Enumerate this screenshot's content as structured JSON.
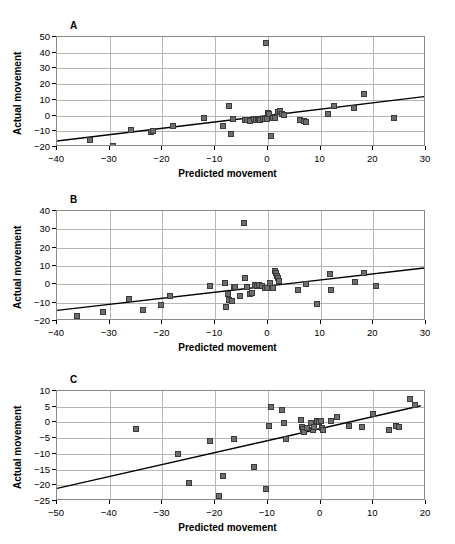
{
  "page": {
    "running_head": "",
    "page_number": ""
  },
  "axis": {
    "xlabel": "Predicted movement",
    "ylabel": "Actual movement"
  },
  "chart_data": [
    {
      "type": "scatter",
      "panel": "A",
      "title": "",
      "xlabel": "Predicted movement",
      "ylabel": "Actual movement",
      "xlim": [
        -40,
        30
      ],
      "ylim": [
        -20,
        50
      ],
      "xticks": [
        -40,
        -30,
        -20,
        -10,
        0,
        10,
        20,
        30
      ],
      "yticks": [
        -20,
        -10,
        0,
        10,
        20,
        30,
        40,
        50
      ],
      "grid": true,
      "legend": "none",
      "marker": "filled-square",
      "trendline": {
        "x": [
          -40,
          30
        ],
        "y": [
          -16.2,
          12.2
        ]
      },
      "points": [
        [
          -33.8,
          -15.6
        ],
        [
          -29.4,
          -19.3
        ],
        [
          -26.0,
          -9.4
        ],
        [
          -22.2,
          -10.2
        ],
        [
          -21.7,
          -9.8
        ],
        [
          -18.0,
          -6.8
        ],
        [
          -12.1,
          -1.8
        ],
        [
          -8.6,
          -6.7
        ],
        [
          -7.3,
          6.3
        ],
        [
          -7.0,
          -11.6
        ],
        [
          -6.6,
          -2.0
        ],
        [
          -4.3,
          -3.0
        ],
        [
          -3.9,
          -2.6
        ],
        [
          -3.3,
          -3.2
        ],
        [
          -2.6,
          -2.3
        ],
        [
          -2.3,
          -2.6
        ],
        [
          -1.9,
          -2.4
        ],
        [
          -1.6,
          -2.2
        ],
        [
          -1.4,
          -3.0
        ],
        [
          -1.0,
          -2.2
        ],
        [
          -0.6,
          -1.9
        ],
        [
          -0.4,
          46.0
        ],
        [
          -0.2,
          -2.0
        ],
        [
          0.1,
          1.8
        ],
        [
          0.3,
          0.8
        ],
        [
          0.6,
          -13.0
        ],
        [
          0.9,
          -1.6
        ],
        [
          1.4,
          -1.3
        ],
        [
          2.0,
          2.2
        ],
        [
          2.3,
          2.6
        ],
        [
          2.6,
          0.9
        ],
        [
          3.0,
          0.6
        ],
        [
          6.1,
          -3.0
        ],
        [
          6.8,
          -3.4
        ],
        [
          7.2,
          -4.2
        ],
        [
          11.5,
          0.9
        ],
        [
          12.6,
          5.9
        ],
        [
          16.3,
          4.8
        ],
        [
          18.3,
          13.8
        ],
        [
          23.9,
          -1.6
        ]
      ]
    },
    {
      "type": "scatter",
      "panel": "B",
      "title": "",
      "xlabel": "Predicted movement",
      "ylabel": "Actual movement",
      "xlim": [
        -40,
        30
      ],
      "ylim": [
        -20,
        40
      ],
      "xticks": [
        -40,
        -30,
        -20,
        -10,
        0,
        10,
        20,
        30
      ],
      "yticks": [
        -20,
        -10,
        0,
        10,
        20,
        30,
        40
      ],
      "grid": true,
      "legend": "none",
      "marker": "filled-square",
      "trendline": {
        "x": [
          -40,
          30
        ],
        "y": [
          -14.2,
          9.0
        ]
      },
      "points": [
        [
          -36.3,
          -17.2
        ],
        [
          -31.2,
          -15.2
        ],
        [
          -26.4,
          -7.9
        ],
        [
          -23.7,
          -14.1
        ],
        [
          -20.2,
          -11.3
        ],
        [
          -18.6,
          -6.5
        ],
        [
          -11.0,
          -1.1
        ],
        [
          -8.1,
          0.6
        ],
        [
          -7.9,
          -12.3
        ],
        [
          -7.6,
          -5.2
        ],
        [
          -7.3,
          -8.7
        ],
        [
          -6.8,
          -8.9
        ],
        [
          -6.5,
          -1.4
        ],
        [
          -6.2,
          -1.7
        ],
        [
          -5.3,
          -6.4
        ],
        [
          -4.6,
          33.4
        ],
        [
          -4.4,
          3.7
        ],
        [
          -4.0,
          -1.2
        ],
        [
          -3.4,
          -5.0
        ],
        [
          -3.0,
          -4.5
        ],
        [
          -2.4,
          -0.6
        ],
        [
          -2.1,
          -0.9
        ],
        [
          -1.6,
          -0.5
        ],
        [
          -1.2,
          -0.8
        ],
        [
          -0.6,
          -2.2
        ],
        [
          -0.2,
          -1.8
        ],
        [
          0.4,
          0.5
        ],
        [
          1.0,
          -2.1
        ],
        [
          1.4,
          7.4
        ],
        [
          1.6,
          6.1
        ],
        [
          1.8,
          4.8
        ],
        [
          2.0,
          3.2
        ],
        [
          2.2,
          2.0
        ],
        [
          5.8,
          -2.9
        ],
        [
          7.3,
          0.2
        ],
        [
          9.4,
          -10.9
        ],
        [
          11.8,
          5.4
        ],
        [
          12.0,
          -3.1
        ],
        [
          16.5,
          1.1
        ],
        [
          18.2,
          6.4
        ],
        [
          20.5,
          -1.0
        ]
      ]
    },
    {
      "type": "scatter",
      "panel": "C",
      "title": "",
      "xlabel": "Predicted movement",
      "ylabel": "Actual movement",
      "xlim": [
        -50,
        20
      ],
      "ylim": [
        -25,
        10
      ],
      "xticks": [
        -50,
        -40,
        -30,
        -20,
        -10,
        0,
        10,
        20
      ],
      "yticks": [
        -25,
        -20,
        -15,
        -10,
        -5,
        0,
        5,
        10
      ],
      "grid": true,
      "legend": "none",
      "marker": "filled-square",
      "trendline": {
        "x": [
          -50,
          19
        ],
        "y": [
          -21.0,
          5.3
        ]
      },
      "points": [
        [
          -48.7,
          -25.3
        ],
        [
          -35.1,
          -2.0
        ],
        [
          -27.0,
          -10.1
        ],
        [
          -24.9,
          -19.4
        ],
        [
          -21.0,
          -6.0
        ],
        [
          -19.3,
          -23.5
        ],
        [
          -18.6,
          -17.2
        ],
        [
          -16.4,
          -5.2
        ],
        [
          -12.6,
          -14.2
        ],
        [
          -10.3,
          -21.2
        ],
        [
          -9.7,
          -1.2
        ],
        [
          -9.4,
          4.8
        ],
        [
          -7.3,
          3.9
        ],
        [
          -6.9,
          -0.2
        ],
        [
          -6.6,
          -5.3
        ],
        [
          -3.7,
          0.9
        ],
        [
          -3.5,
          -1.6
        ],
        [
          -3.3,
          -2.0
        ],
        [
          -3.1,
          -3.2
        ],
        [
          -2.6,
          -1.8
        ],
        [
          -1.9,
          -0.2
        ],
        [
          -1.5,
          -2.3
        ],
        [
          -1.2,
          -1.4
        ],
        [
          -0.6,
          0.6
        ],
        [
          -0.3,
          0.2
        ],
        [
          0.0,
          0.6
        ],
        [
          0.2,
          -1.9
        ],
        [
          0.4,
          -2.3
        ],
        [
          2.0,
          0.4
        ],
        [
          3.1,
          1.7
        ],
        [
          5.4,
          -1.2
        ],
        [
          7.9,
          -1.4
        ],
        [
          9.9,
          2.6
        ],
        [
          13.0,
          -2.4
        ],
        [
          14.3,
          -1.1
        ],
        [
          14.9,
          -1.3
        ],
        [
          16.9,
          7.5
        ],
        [
          17.9,
          5.5
        ]
      ]
    }
  ]
}
